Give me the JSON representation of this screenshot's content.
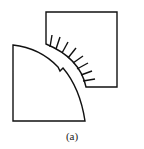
{
  "figure": {
    "caption": "(a)",
    "stroke_color": "#111111",
    "shapes": [
      "square-with-hairs",
      "quarter-circle-with-notch"
    ]
  }
}
